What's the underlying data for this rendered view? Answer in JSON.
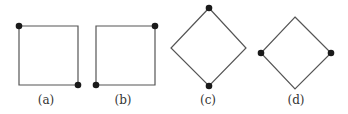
{
  "figure": {
    "panels": [
      {
        "id": "a",
        "label": "(a)",
        "shape": "square",
        "vertices": [
          [
            19,
            26
          ],
          [
            78,
            26
          ],
          [
            78,
            85
          ],
          [
            19,
            85
          ]
        ],
        "marked_vertices": [
          [
            19,
            26
          ],
          [
            78,
            85
          ]
        ],
        "label_pos": [
          46,
          104
        ]
      },
      {
        "id": "b",
        "label": "(b)",
        "shape": "square",
        "vertices": [
          [
            96,
            26
          ],
          [
            155,
            26
          ],
          [
            155,
            85
          ],
          [
            96,
            85
          ]
        ],
        "marked_vertices": [
          [
            155,
            26
          ],
          [
            96,
            85
          ]
        ],
        "label_pos": [
          123,
          104
        ]
      },
      {
        "id": "c",
        "label": "(c)",
        "shape": "diamond",
        "vertices": [
          [
            209,
            8
          ],
          [
            246,
            48
          ],
          [
            209,
            86
          ],
          [
            171,
            48
          ]
        ],
        "marked_vertices": [
          [
            209,
            8
          ],
          [
            209,
            86
          ]
        ],
        "label_pos": [
          208,
          104
        ]
      },
      {
        "id": "d",
        "label": "(d)",
        "shape": "diamond",
        "vertices": [
          [
            295,
            17
          ],
          [
            331,
            53
          ],
          [
            295,
            89
          ],
          [
            261,
            53
          ]
        ],
        "marked_vertices": [
          [
            261,
            53
          ],
          [
            331,
            53
          ]
        ],
        "label_pos": [
          296,
          104
        ]
      }
    ],
    "colors": {
      "stroke": "#555555",
      "dot": "#1a1a1a",
      "label": "#333333",
      "background": "#ffffff"
    }
  }
}
